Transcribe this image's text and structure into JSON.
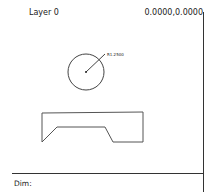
{
  "header": {
    "layer_label": "Layer 0",
    "coordinates": "0.0000,0.0000"
  },
  "drawing": {
    "circle": {
      "cx": 86,
      "cy": 72,
      "r": 18,
      "label": "R1.2500"
    },
    "polygon": {
      "points": "42,113 143,112 143,142 113,142 105,127 57,127 42,142"
    }
  },
  "command_line": {
    "prompt": "Dim:"
  }
}
